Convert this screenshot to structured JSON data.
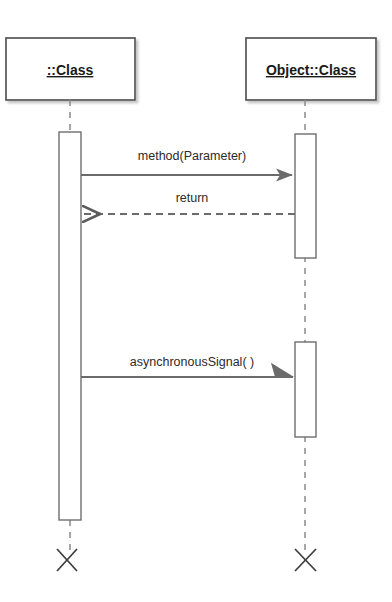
{
  "diagram": {
    "type": "uml-sequence-diagram",
    "background_color": "#ffffff",
    "line_color": "#6b6b6b",
    "box_border_color": "#4a4a4a",
    "box_fill_color": "#ffffff",
    "text_color": "#1a1a1a",
    "lifelines": [
      {
        "id": "left",
        "label": "::Class",
        "label_underlined": true,
        "box": {
          "x": 6,
          "y": 38,
          "width": 129,
          "height": 62
        },
        "center_x": 70,
        "activations": [
          {
            "x": 59,
            "y": 132,
            "width": 22,
            "height": 388
          }
        ],
        "destroy_marker": {
          "x": 66,
          "y": 560,
          "symbol": "X"
        }
      },
      {
        "id": "right",
        "label": "Object::Class",
        "label_underlined": true,
        "box": {
          "x": 246,
          "y": 38,
          "width": 130,
          "height": 62
        },
        "center_x": 305,
        "activations": [
          {
            "x": 295,
            "y": 134,
            "width": 21,
            "height": 124
          },
          {
            "x": 295,
            "y": 342,
            "width": 21,
            "height": 95
          }
        ],
        "destroy_marker": {
          "x": 305,
          "y": 560,
          "symbol": "X"
        }
      }
    ],
    "messages": [
      {
        "id": "msg-method",
        "label": "method(Parameter)",
        "from": "left",
        "to": "right",
        "direction": "right",
        "line_style": "solid",
        "arrowhead": "filled",
        "y": 175,
        "label_x": 192,
        "label_y": 160,
        "x_start": 81,
        "x_end": 295
      },
      {
        "id": "msg-return",
        "label": "return",
        "from": "right",
        "to": "left",
        "direction": "left",
        "line_style": "dashed",
        "arrowhead": "open",
        "y": 214,
        "label_x": 192,
        "label_y": 202,
        "x_start": 295,
        "x_end": 81
      },
      {
        "id": "msg-async",
        "label": "asynchronousSignal( )",
        "from": "left",
        "to": "right",
        "direction": "right",
        "line_style": "solid",
        "arrowhead": "half-open",
        "y": 377,
        "label_x": 192,
        "label_y": 366,
        "x_start": 81,
        "x_end": 295
      }
    ]
  }
}
